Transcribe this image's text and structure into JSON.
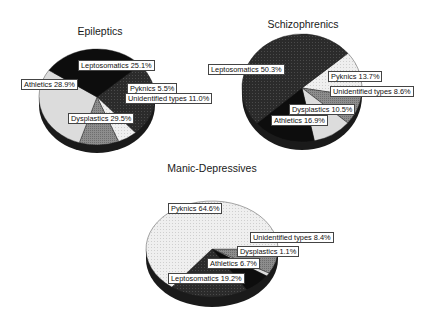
{
  "chart_data": [
    {
      "type": "pie",
      "title": "Epileptics",
      "slices": [
        {
          "label": "Leptosomatics",
          "value": 25.1,
          "text": "Leptosomatics 25.1%"
        },
        {
          "label": "Pyknics",
          "value": 5.5,
          "text": "Pyknics 5.5%"
        },
        {
          "label": "Unidentified types",
          "value": 11.0,
          "text": "Unidentified types 11.0%"
        },
        {
          "label": "Dysplastics",
          "value": 29.5,
          "text": "Dysplastics 29.5%"
        },
        {
          "label": "Athletics",
          "value": 28.9,
          "text": "Athletics 28.9%"
        }
      ]
    },
    {
      "type": "pie",
      "title": "Schizophrenics",
      "slices": [
        {
          "label": "Pyknics",
          "value": 13.7,
          "text": "Pyknics 13.7%"
        },
        {
          "label": "Unidentified types",
          "value": 8.6,
          "text": "Unidentified types 8.6%"
        },
        {
          "label": "Dysplastics",
          "value": 10.5,
          "text": "Dysplastics 10.5%"
        },
        {
          "label": "Athletics",
          "value": 16.9,
          "text": "Athletics 16.9%"
        },
        {
          "label": "Leptosomatics",
          "value": 50.3,
          "text": "Leptosomatics 50.3%"
        }
      ]
    },
    {
      "type": "pie",
      "title": "Manic-Depressives",
      "slices": [
        {
          "label": "Unidentified types",
          "value": 8.4,
          "text": "Unidentified types 8.4%"
        },
        {
          "label": "Dysplastics",
          "value": 1.1,
          "text": "Dysplastics 1.1%"
        },
        {
          "label": "Athletics",
          "value": 6.7,
          "text": "Athletics 6.7%"
        },
        {
          "label": "Leptosomatics",
          "value": 19.2,
          "text": "Leptosomatics 19.2%"
        },
        {
          "label": "Pyknics",
          "value": 64.6,
          "text": "Pyknics 64.6%"
        }
      ]
    }
  ],
  "colors": {
    "Leptosomatics": "#2e2e2e",
    "Athletics": "#0d0d0d",
    "Pyknics": "#ececec",
    "Unidentified types": "#8a8a8a",
    "Dysplastics": "#dcdcdc",
    "rim": "#1a1a1a",
    "label_border": "#444444"
  }
}
